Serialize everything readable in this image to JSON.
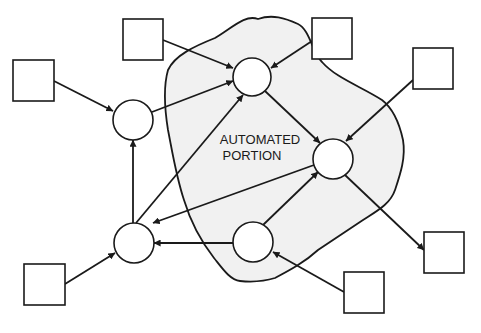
{
  "diagram": {
    "label_line1": "AUTOMATED",
    "label_line2": "PORTION",
    "colors": {
      "stroke": "#1a1a1a",
      "region_fill": "#f1f1f1",
      "node_fill": "#ffffff",
      "background": "#ffffff"
    },
    "nodes": [
      {
        "id": "A",
        "type": "process",
        "cx": 252,
        "cy": 77,
        "r": 19
      },
      {
        "id": "B",
        "type": "process",
        "cx": 133,
        "cy": 120,
        "r": 20
      },
      {
        "id": "C",
        "type": "process",
        "cx": 333,
        "cy": 159,
        "r": 20
      },
      {
        "id": "D",
        "type": "process",
        "cx": 134,
        "cy": 243,
        "r": 20
      },
      {
        "id": "E",
        "type": "process",
        "cx": 253,
        "cy": 242,
        "r": 20
      }
    ],
    "boxes": [
      {
        "id": "X1",
        "type": "external",
        "x": 123,
        "y": 19,
        "w": 40,
        "h": 41
      },
      {
        "id": "X2",
        "type": "external",
        "x": 13,
        "y": 60,
        "w": 41,
        "h": 41
      },
      {
        "id": "X3",
        "type": "external",
        "x": 312,
        "y": 18,
        "w": 40,
        "h": 41
      },
      {
        "id": "X4",
        "type": "external",
        "x": 413,
        "y": 48,
        "w": 40,
        "h": 41
      },
      {
        "id": "X5",
        "type": "external",
        "x": 24,
        "y": 264,
        "w": 41,
        "h": 41
      },
      {
        "id": "X6",
        "type": "external",
        "x": 424,
        "y": 232,
        "w": 40,
        "h": 41
      },
      {
        "id": "X7",
        "type": "external",
        "x": 344,
        "y": 272,
        "w": 40,
        "h": 41
      }
    ],
    "edges": [
      {
        "from": "X1",
        "to": "A"
      },
      {
        "from": "X3",
        "to": "A"
      },
      {
        "from": "B",
        "to": "A"
      },
      {
        "from": "D",
        "to": "A"
      },
      {
        "from": "X2",
        "to": "B"
      },
      {
        "from": "D",
        "to": "B"
      },
      {
        "from": "A",
        "to": "C"
      },
      {
        "from": "X4",
        "to": "C"
      },
      {
        "from": "E",
        "to": "C"
      },
      {
        "from": "C",
        "to": "D"
      },
      {
        "from": "E",
        "to": "D"
      },
      {
        "from": "X5",
        "to": "D"
      },
      {
        "from": "X7",
        "to": "E"
      },
      {
        "from": "C",
        "to": "X6"
      }
    ]
  }
}
